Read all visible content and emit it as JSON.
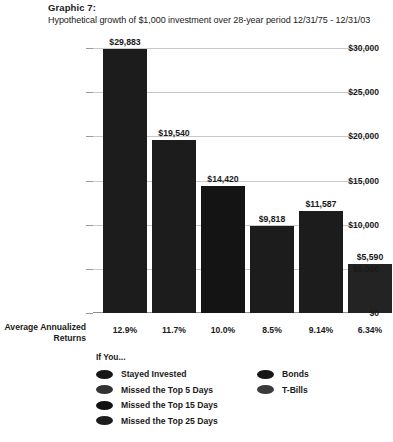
{
  "header": {
    "title": "Graphic 7:",
    "subtitle": "Hypothetical growth of $1,000 investment over 28-year period 12/31/75 - 12/31/03"
  },
  "axis": {
    "returns_label_line1": "Average Annualized",
    "returns_label_line2": "Returns"
  },
  "legend": {
    "title": "If You...",
    "items": [
      {
        "label": "Stayed Invested",
        "swatch": "legend-swatch-stayed-invested"
      },
      {
        "label": "Missed the Top 5 Days",
        "swatch": "legend-swatch-missed-5"
      },
      {
        "label": "Missed the Top 15 Days",
        "swatch": "legend-swatch-missed-15"
      },
      {
        "label": "Missed the Top 25 Days",
        "swatch": "legend-swatch-missed-25"
      },
      {
        "label": "Bonds",
        "swatch": "legend-swatch-bonds"
      },
      {
        "label": "T-Bills",
        "swatch": "legend-swatch-tbills"
      }
    ]
  },
  "chart_data": {
    "type": "bar",
    "title": "Graphic 7:",
    "subtitle": "Hypothetical growth of $1,000 investment over 28-year period 12/31/75 - 12/31/03",
    "xlabel": "",
    "ylabel": "",
    "ylim": [
      0,
      30000
    ],
    "grid": true,
    "legend_position": "bottom",
    "ytick_labels": [
      "$30,000",
      "$25,000",
      "$20,000",
      "$15,000",
      "$10,000",
      "$5,000",
      "$0"
    ],
    "ytick_values": [
      30000,
      25000,
      20000,
      15000,
      10000,
      5000,
      0
    ],
    "categories": [
      "Stayed Invested",
      "Missed the Top 5 Days",
      "Missed the Top 15 Days",
      "Missed the Top 25 Days",
      "Bonds",
      "T-Bills"
    ],
    "values": [
      29883,
      19540,
      14420,
      9818,
      11587,
      5590
    ],
    "value_labels": [
      "$29,883",
      "$19,540",
      "$14,420",
      "$9,818",
      "$11,587",
      "$5,590"
    ],
    "annualized_returns": [
      "12.9%",
      "11.7%",
      "10.0%",
      "8.5%",
      "9.14%",
      "6.34%"
    ],
    "bar_color": "#1c1c1c",
    "grid_color": "#c9c9c9",
    "background": "#ffffff"
  }
}
